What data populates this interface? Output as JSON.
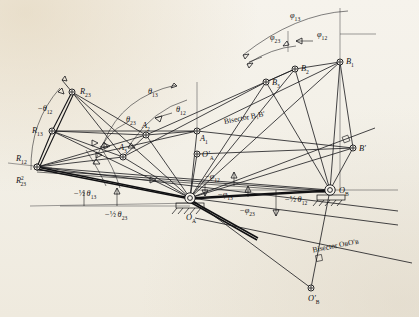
{
  "figure": {
    "background_color": "#f4f1ea",
    "ink_color": "#17171a"
  },
  "nodes": [
    {
      "id": "R23",
      "label": "R",
      "sub": "23",
      "sup": "",
      "x": 72.0,
      "y": 92.0,
      "label_dx": 8,
      "label_dy": 2
    },
    {
      "id": "R13",
      "label": "R",
      "sub": "13",
      "sup": "",
      "x": 52.0,
      "y": 131.0,
      "label_dx": -20,
      "label_dy": 2
    },
    {
      "id": "R12",
      "label": "R",
      "sub": "12",
      "sup": "",
      "x": 37.0,
      "y": 167.0,
      "label_dx": -21,
      "label_dy": -6
    },
    {
      "id": "R23b",
      "label": "R",
      "sub": "23",
      "sup": "2",
      "x": 37.0,
      "y": 167.0,
      "label_dx": -21,
      "label_dy": 16
    },
    {
      "id": "A2",
      "label": "A",
      "sub": "2",
      "sup": "",
      "x": 146.0,
      "y": 135.0,
      "label_dx": -4,
      "label_dy": -7
    },
    {
      "id": "A1",
      "label": "A",
      "sub": "1",
      "sup": "",
      "x": 197.0,
      "y": 131.0,
      "label_dx": 3,
      "label_dy": 10
    },
    {
      "id": "A3",
      "label": "A",
      "sub": "3",
      "sup": "",
      "x": 123.0,
      "y": 157.0,
      "label_dx": -4,
      "label_dy": -7
    },
    {
      "id": "OAp",
      "label": "O",
      "sub": "A",
      "sup": "",
      "x": 197.0,
      "y": 154.0,
      "label_dx": 5,
      "label_dy": 3,
      "prime": true
    },
    {
      "id": "OA",
      "label": "O",
      "sub": "A",
      "sup": "",
      "x": 190.0,
      "y": 198.0,
      "label_dx": -4,
      "label_dy": 22
    },
    {
      "id": "OB",
      "label": "O",
      "sub": "B",
      "sup": "",
      "x": 330.0,
      "y": 190.0,
      "label_dx": 9,
      "label_dy": 3
    },
    {
      "id": "OBp",
      "label": "O",
      "sub": "B",
      "sup": "",
      "x": 311.0,
      "y": 288.0,
      "label_dx": -3,
      "label_dy": 13,
      "prime": true
    },
    {
      "id": "B1",
      "label": "B",
      "sub": "1",
      "sup": "",
      "x": 340.0,
      "y": 62.0,
      "label_dx": 6,
      "label_dy": 2
    },
    {
      "id": "B2",
      "label": "B",
      "sub": "2",
      "sup": "",
      "x": 295.0,
      "y": 69.0,
      "label_dx": 6,
      "label_dy": 2
    },
    {
      "id": "B3",
      "label": "B",
      "sub": "3",
      "sup": "",
      "x": 266.0,
      "y": 82.0,
      "label_dx": 6,
      "label_dy": 3
    },
    {
      "id": "Bp",
      "label": "B",
      "sub": "",
      "sup": "",
      "x": 353.0,
      "y": 148.0,
      "label_dx": 6,
      "label_dy": 3,
      "prime": true
    }
  ],
  "angle_labels": [
    {
      "id": "phi13",
      "text": "φ",
      "sub": "13",
      "prefix": "",
      "x": 290,
      "y": 18,
      "frac": false
    },
    {
      "id": "phi23",
      "text": "φ",
      "sub": "23",
      "prefix": "",
      "x": 270,
      "y": 40,
      "frac": false
    },
    {
      "id": "phi12",
      "text": "φ",
      "sub": "12",
      "prefix": "",
      "x": 317,
      "y": 37,
      "frac": false
    },
    {
      "id": "theta13",
      "text": "θ",
      "sub": "13",
      "prefix": "",
      "x": 148,
      "y": 94,
      "frac": false
    },
    {
      "id": "theta12",
      "text": "θ",
      "sub": "12",
      "prefix": "",
      "x": 176,
      "y": 112,
      "frac": false
    },
    {
      "id": "theta23",
      "text": "θ",
      "sub": "23",
      "prefix": "",
      "x": 126,
      "y": 122,
      "frac": false
    },
    {
      "id": "mtheta12",
      "text": "θ",
      "sub": "12",
      "prefix": "−",
      "x": 38,
      "y": 111,
      "frac": false
    },
    {
      "id": "mphi12",
      "text": "φ",
      "sub": "12",
      "prefix": "−",
      "x": 205,
      "y": 179,
      "frac": false
    },
    {
      "id": "mphi13",
      "text": "φ",
      "sub": "13",
      "prefix": "−",
      "x": 218,
      "y": 197,
      "frac": false
    },
    {
      "id": "mphi23",
      "text": "φ",
      "sub": "23",
      "prefix": "−",
      "x": 240,
      "y": 213,
      "frac": false
    },
    {
      "id": "mhalftheta13",
      "text": "θ",
      "sub": "13",
      "prefix": "−½",
      "x": 74,
      "y": 196,
      "frac": true
    },
    {
      "id": "mhalftheta23",
      "text": "θ",
      "sub": "23",
      "prefix": "−½",
      "x": 105,
      "y": 217,
      "frac": true
    },
    {
      "id": "mhalftheta12",
      "text": "θ",
      "sub": "12",
      "prefix": "−½",
      "x": 285,
      "y": 202,
      "frac": true
    }
  ],
  "text_labels": [
    {
      "id": "bisector-b1bp",
      "text": "Bisector B₁B′",
      "x": 245,
      "y": 120,
      "rotate": -11
    },
    {
      "id": "bisector-ob",
      "text": "Bisector OʙO′ʙ",
      "x": 336,
      "y": 248,
      "rotate": -11
    }
  ],
  "ground_pivots": [
    "OA",
    "OB"
  ],
  "legend_note": ""
}
